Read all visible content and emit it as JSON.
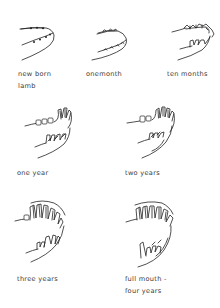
{
  "stages": [
    {
      "id": "newborn",
      "label_lines": [
        "new born",
        "lamb"
      ]
    },
    {
      "id": "one-month",
      "label_lines": [
        "onemonth"
      ]
    },
    {
      "id": "ten-months",
      "label_lines": [
        "ten months"
      ]
    },
    {
      "id": "one-year",
      "label_lines": [
        "one  year"
      ]
    },
    {
      "id": "two-years",
      "label_lines": [
        "two  years"
      ]
    },
    {
      "id": "three-years",
      "label_lines": [
        "three  years"
      ]
    },
    {
      "id": "four-years",
      "label_lines": [
        "full  mouth -",
        "four  years"
      ]
    }
  ],
  "colors": {
    "ink": "#222222",
    "text": "#3a3a3a",
    "background": "#ffffff"
  }
}
